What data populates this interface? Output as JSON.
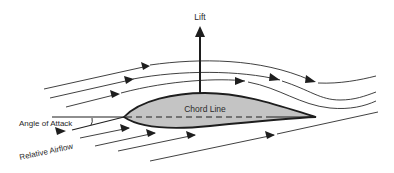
{
  "diagram": {
    "labels": {
      "lift": "Lift",
      "chord_line": "Chord Line",
      "angle_of_attack": "Angle of Attack",
      "relative_airflow": "Relative Airflow"
    },
    "colors": {
      "airfoil_fill": "#c4c4c4",
      "stroke": "#1e1e1e",
      "background": "#ffffff"
    }
  }
}
